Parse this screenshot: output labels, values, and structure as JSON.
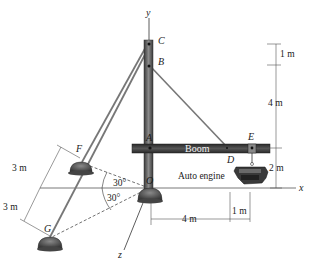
{
  "figure": {
    "type": "engineering statics diagram"
  },
  "labels": {
    "axis_x": "x",
    "axis_y": "y",
    "axis_z": "z",
    "point_A": "A",
    "point_B": "B",
    "point_C": "C",
    "point_D": "D",
    "point_E": "E",
    "point_F": "F",
    "point_G": "G",
    "point_O": "O",
    "boom": "Boom",
    "engine": "Auto engine"
  },
  "dimensions": {
    "top_gap": "1 m",
    "upper_height": "4 m",
    "boom_height": "2 m",
    "horiz_4m": "4 m",
    "horiz_1m": "1 m",
    "f_dist": "3 m",
    "g_dist": "3 m",
    "angle_upper": "30°",
    "angle_lower": "30°"
  },
  "colors": {
    "mast": "#4a4a4a",
    "boom": "#333333",
    "cable": "#6d6d6d",
    "ink": "#1a1a1a",
    "support": "#5a5a5a"
  }
}
